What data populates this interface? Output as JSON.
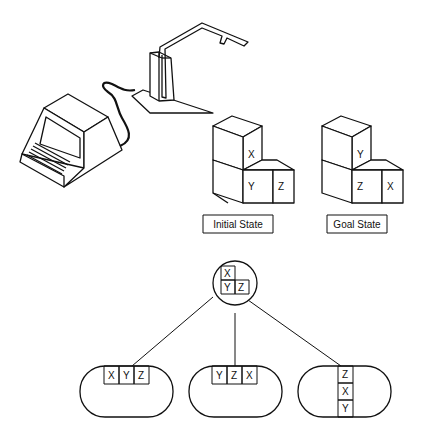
{
  "figure": {
    "labels": {
      "initial_state": "Initial State",
      "goal_state": "Goal State"
    },
    "initial_state_blocks": {
      "top": "X",
      "bottom_left": "Y",
      "bottom_right": "Z"
    },
    "goal_state_blocks": {
      "top": "Y",
      "bottom_left": "Z",
      "bottom_right": "X"
    },
    "tree": {
      "root": {
        "top": "X",
        "bottom_left": "Y",
        "bottom_right": "Z"
      },
      "children": [
        {
          "cells": [
            "X",
            "Y",
            "Z"
          ],
          "orientation": "horizontal"
        },
        {
          "cells": [
            "Y",
            "Z",
            "X"
          ],
          "orientation": "horizontal"
        },
        {
          "cells": [
            "Z",
            "X",
            "Y"
          ],
          "orientation": "vertical"
        }
      ]
    },
    "icons": [
      "computer-terminal-icon",
      "robot-arm-icon"
    ]
  }
}
